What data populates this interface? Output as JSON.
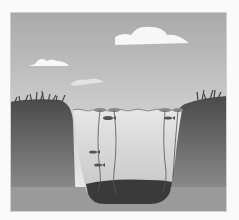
{
  "image": {
    "description": "Grayscale illustration of a pond cross-section with sky, clouds, grassy banks, water with aquatic plants and fish, and dark sediment at the bottom",
    "colors": {
      "sky_top": "#a9a9a9",
      "sky_bottom": "#f2f2f2",
      "cloud": "#f7f7f7",
      "ground_top": "#4a4a4a",
      "ground_bottom": "#9a9a9a",
      "water_top": "#e6e6e6",
      "water_bottom": "#c4c4c4",
      "sediment": "#3a3a3a",
      "plant": "#555555",
      "border": "#d0d0d0"
    },
    "elements": {
      "clouds": 3,
      "fish": 4,
      "plant_stems": 4,
      "grass_clumps": 2
    }
  }
}
